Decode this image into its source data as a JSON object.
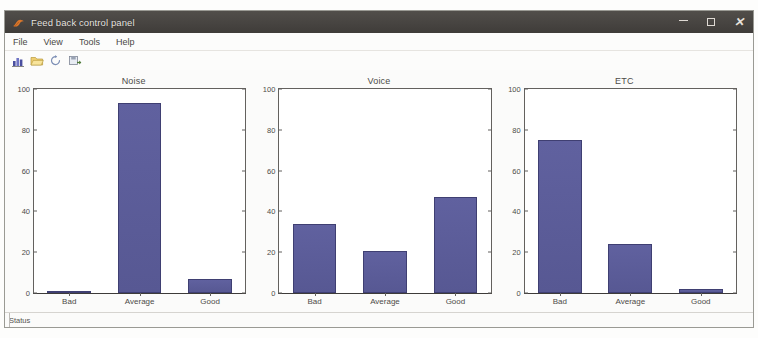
{
  "window": {
    "title": "Feed back control panel",
    "icon": "matlab-figure-icon",
    "controls": {
      "minimize": "minimize-button",
      "maximize": "maximize-button",
      "close": "close-button"
    }
  },
  "menubar": {
    "items": [
      {
        "label": "File"
      },
      {
        "label": "View"
      },
      {
        "label": "Tools"
      },
      {
        "label": "Help"
      }
    ]
  },
  "toolbar": {
    "buttons": [
      {
        "icon": "bar-chart-icon",
        "tooltip": "Plot"
      },
      {
        "icon": "open-folder-icon",
        "tooltip": "Open"
      },
      {
        "icon": "refresh-arrow-icon",
        "tooltip": "Refresh"
      },
      {
        "icon": "save-export-icon",
        "tooltip": "Export"
      }
    ]
  },
  "colors": {
    "bar_fill": "#5b5c9c",
    "bar_edge": "#3f3f72",
    "titlebar": "#474441",
    "axis": "#63615e"
  },
  "controls": {
    "refresh_label": "Refresh"
  },
  "statusbar": {
    "text": "Status"
  },
  "chart_data": [
    {
      "type": "bar",
      "title": "Noise",
      "categories": [
        "Bad",
        "Average",
        "Good"
      ],
      "values": [
        1,
        93,
        7
      ],
      "xlabel": "",
      "ylabel": "",
      "ylim": [
        0,
        100
      ],
      "yticks": [
        0,
        20,
        40,
        60,
        80,
        100
      ],
      "grid": false,
      "legend": false
    },
    {
      "type": "bar",
      "title": "Voice",
      "categories": [
        "Bad",
        "Average",
        "Good"
      ],
      "values": [
        34,
        20.5,
        47
      ],
      "xlabel": "",
      "ylabel": "",
      "ylim": [
        0,
        100
      ],
      "yticks": [
        0,
        20,
        40,
        60,
        80,
        100
      ],
      "grid": false,
      "legend": false
    },
    {
      "type": "bar",
      "title": "ETC",
      "categories": [
        "Bad",
        "Average",
        "Good"
      ],
      "values": [
        75,
        24,
        2
      ],
      "xlabel": "",
      "ylabel": "",
      "ylim": [
        0,
        100
      ],
      "yticks": [
        0,
        20,
        40,
        60,
        80,
        100
      ],
      "grid": false,
      "legend": false
    }
  ]
}
